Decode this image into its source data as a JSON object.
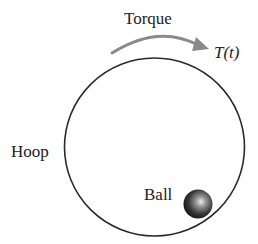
{
  "diagram": {
    "labels": {
      "torque": "Torque",
      "torque_symbol": "T(t)",
      "hoop": "Hoop",
      "ball": "Ball"
    },
    "colors": {
      "hoop_stroke": "#2a2a2a",
      "arrow": "#8a8a8a",
      "ball_dark": "#1a1a1a",
      "ball_highlight": "#e8e8e8",
      "text": "#222222"
    }
  }
}
